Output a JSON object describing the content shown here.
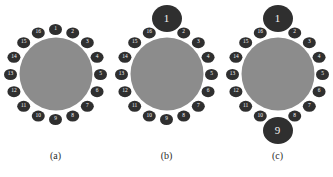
{
  "figure": {
    "background_color": "#ffffff",
    "disc_color": "#8c8c8c",
    "node_color": "#2f2f2f",
    "node_text_color": "#f4f4f4",
    "node_count": 16,
    "node_labels": [
      "1",
      "2",
      "3",
      "4",
      "5",
      "6",
      "7",
      "8",
      "9",
      "10",
      "11",
      "12",
      "13",
      "14",
      "15",
      "16"
    ]
  },
  "panels": [
    {
      "id": "a",
      "caption": "(a)",
      "disc_diameter": 73,
      "ring_radius": 45,
      "highlighted": [],
      "nodes": [
        {
          "label": "1",
          "angle": 0,
          "size": "small"
        },
        {
          "label": "2",
          "angle": 22.5,
          "size": "small"
        },
        {
          "label": "3",
          "angle": 45,
          "size": "small"
        },
        {
          "label": "4",
          "angle": 67.5,
          "size": "small"
        },
        {
          "label": "5",
          "angle": 90,
          "size": "small"
        },
        {
          "label": "6",
          "angle": 112.5,
          "size": "small"
        },
        {
          "label": "7",
          "angle": 135,
          "size": "small"
        },
        {
          "label": "8",
          "angle": 157.5,
          "size": "small"
        },
        {
          "label": "9",
          "angle": 180,
          "size": "small"
        },
        {
          "label": "10",
          "angle": 202.5,
          "size": "small"
        },
        {
          "label": "11",
          "angle": 225,
          "size": "small"
        },
        {
          "label": "12",
          "angle": 247.5,
          "size": "small"
        },
        {
          "label": "13",
          "angle": 270,
          "size": "small"
        },
        {
          "label": "14",
          "angle": 292.5,
          "size": "small"
        },
        {
          "label": "15",
          "angle": 315,
          "size": "small"
        },
        {
          "label": "16",
          "angle": 337.5,
          "size": "small"
        }
      ]
    },
    {
      "id": "b",
      "caption": "(b)",
      "disc_diameter": 73,
      "ring_radius": 45,
      "highlighted": [
        "1"
      ],
      "nodes": [
        {
          "label": "1",
          "angle": 0,
          "size": "large"
        },
        {
          "label": "2",
          "angle": 22.5,
          "size": "small"
        },
        {
          "label": "3",
          "angle": 45,
          "size": "small"
        },
        {
          "label": "4",
          "angle": 67.5,
          "size": "small"
        },
        {
          "label": "5",
          "angle": 90,
          "size": "small"
        },
        {
          "label": "6",
          "angle": 112.5,
          "size": "small"
        },
        {
          "label": "7",
          "angle": 135,
          "size": "small"
        },
        {
          "label": "8",
          "angle": 157.5,
          "size": "small"
        },
        {
          "label": "9",
          "angle": 180,
          "size": "small"
        },
        {
          "label": "10",
          "angle": 202.5,
          "size": "small"
        },
        {
          "label": "11",
          "angle": 225,
          "size": "small"
        },
        {
          "label": "12",
          "angle": 247.5,
          "size": "small"
        },
        {
          "label": "13",
          "angle": 270,
          "size": "small"
        },
        {
          "label": "14",
          "angle": 292.5,
          "size": "small"
        },
        {
          "label": "15",
          "angle": 315,
          "size": "small"
        },
        {
          "label": "16",
          "angle": 337.5,
          "size": "small"
        }
      ]
    },
    {
      "id": "c",
      "caption": "(c)",
      "disc_diameter": 73,
      "ring_radius": 45,
      "highlighted": [
        "1",
        "9"
      ],
      "nodes": [
        {
          "label": "1",
          "angle": 0,
          "size": "large"
        },
        {
          "label": "2",
          "angle": 22.5,
          "size": "small"
        },
        {
          "label": "3",
          "angle": 45,
          "size": "small"
        },
        {
          "label": "4",
          "angle": 67.5,
          "size": "small"
        },
        {
          "label": "5",
          "angle": 90,
          "size": "small"
        },
        {
          "label": "6",
          "angle": 112.5,
          "size": "small"
        },
        {
          "label": "7",
          "angle": 135,
          "size": "small"
        },
        {
          "label": "8",
          "angle": 157.5,
          "size": "small"
        },
        {
          "label": "9",
          "angle": 180,
          "size": "large"
        },
        {
          "label": "10",
          "angle": 202.5,
          "size": "small"
        },
        {
          "label": "11",
          "angle": 225,
          "size": "small"
        },
        {
          "label": "12",
          "angle": 247.5,
          "size": "small"
        },
        {
          "label": "13",
          "angle": 270,
          "size": "small"
        },
        {
          "label": "14",
          "angle": 292.5,
          "size": "small"
        },
        {
          "label": "15",
          "angle": 315,
          "size": "small"
        },
        {
          "label": "16",
          "angle": 337.5,
          "size": "small"
        }
      ]
    }
  ]
}
